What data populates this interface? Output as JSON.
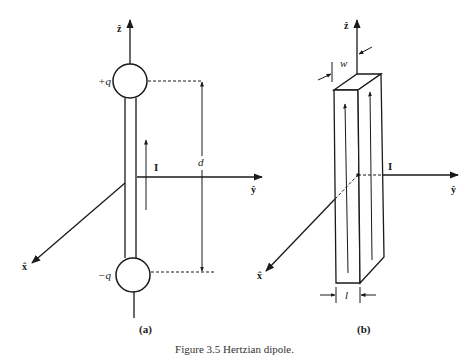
{
  "figure": {
    "caption": "Figure 3.5   Hertzian dipole.",
    "panel_a": {
      "label": "(a)",
      "z_axis": "ẑ",
      "y_axis": "ŷ",
      "x_axis": "x̂",
      "positive_charge": "+q",
      "negative_charge": "−q",
      "current": "I",
      "separation": "d"
    },
    "panel_b": {
      "label": "(b)",
      "z_axis": "ẑ",
      "y_axis": "ŷ",
      "x_axis": "x̂",
      "current": "I",
      "width": "w",
      "length": "l"
    },
    "colors": {
      "ink": "#1a1a1a",
      "background": "#ffffff"
    }
  }
}
